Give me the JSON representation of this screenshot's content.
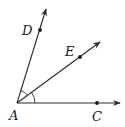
{
  "diagram": {
    "type": "geometry-angles",
    "stroke_color": "#2a2a2a",
    "vertex": {
      "label": "A",
      "x": 17,
      "y": 103,
      "label_x": 9,
      "label_y": 120
    },
    "rays": [
      {
        "name": "AD",
        "to_x": 46,
        "to_y": 8,
        "point": {
          "label": "D",
          "x": 40,
          "y": 30,
          "label_x": 22,
          "label_y": 35
        }
      },
      {
        "name": "AE",
        "to_x": 101,
        "to_y": 41,
        "point": {
          "label": "E",
          "x": 80,
          "y": 56,
          "label_x": 65,
          "label_y": 56
        }
      },
      {
        "name": "AC",
        "to_x": 121,
        "to_y": 103,
        "point": {
          "label": "C",
          "x": 97,
          "y": 103,
          "label_x": 92,
          "label_y": 121
        }
      }
    ],
    "angle_marks": [
      {
        "between": [
          "AD",
          "AE"
        ],
        "radius": 13
      },
      {
        "between": [
          "AE",
          "AC"
        ],
        "radius": 18
      }
    ]
  }
}
